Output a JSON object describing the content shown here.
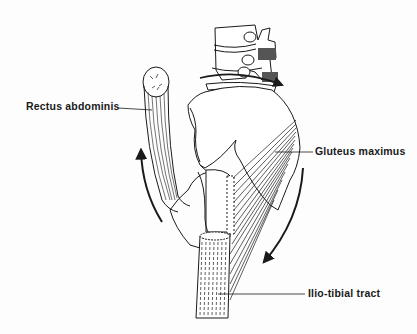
{
  "diagram": {
    "labels": {
      "rectus_abdominis": "Rectus abdominis",
      "gluteus_maximus": "Gluteus maximus",
      "ilio_tibial_tract": "Ilio-tibial tract"
    },
    "arrows": [
      {
        "name": "anterior-upward-rotation",
        "direction": "up"
      },
      {
        "name": "posterior-downward-rotation",
        "direction": "down"
      },
      {
        "name": "lumbar-rotation",
        "direction": "right"
      }
    ],
    "colors": {
      "ink": "#1a1a1a",
      "background": "#fdfdfd",
      "shading": "#555555"
    }
  }
}
